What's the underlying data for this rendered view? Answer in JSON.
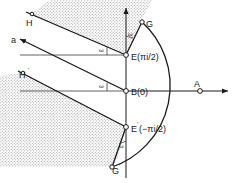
{
  "figure": {
    "background_color": "#ffffff",
    "line_color": "#1a1a1a",
    "shade_color": "#cfcfcf",
    "shade_pattern": "stipple-dots",
    "width": 235,
    "height": 183
  },
  "labels": {
    "H": "H",
    "H_prime": "H",
    "H_prime_mark": "'",
    "a": "a",
    "E_upper": "E(πi/2)",
    "B_origin": "B(0)",
    "E_lower_name": "E",
    "E_lower_mark": "'",
    "E_lower": "(−πi/2)",
    "G": "G",
    "G_prime": "G",
    "G_prime_mark": "'",
    "A": "A",
    "omega_1": "ω",
    "omega_2": "ω",
    "omega_3": "ω",
    "omega_4": "ω"
  },
  "points": {
    "E_upper": {
      "x": 126,
      "y": 55,
      "label": "E(πi/2)"
    },
    "B_origin": {
      "x": 126,
      "y": 91,
      "label": "B(0)"
    },
    "E_lower": {
      "x": 126,
      "y": 127,
      "label": "E'(−πi/2)"
    },
    "G": {
      "x": 142,
      "y": 22,
      "label": "G"
    },
    "G_prime": {
      "x": 112,
      "y": 167,
      "label": "G'"
    },
    "A": {
      "x": 200,
      "y": 91,
      "label": "A"
    },
    "H": {
      "x": 31,
      "y": 15,
      "label": "H"
    },
    "H_prime": {
      "x": 22,
      "y": 73,
      "label": "H'"
    },
    "a_ray": {
      "x": 16,
      "y": 38,
      "label": "a"
    }
  },
  "geometry": {
    "arc_description": "large circular arc from G through A to G'",
    "vertical_axis_x": 126,
    "horizontal_axis_y": 91,
    "angle_label_count": 4
  }
}
